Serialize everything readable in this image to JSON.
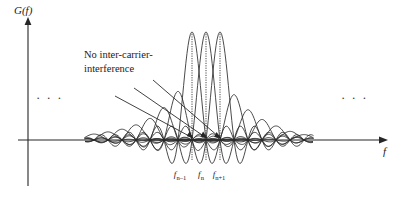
{
  "figure": {
    "title": "",
    "background_color": "#ffffff",
    "line_color": "#2a2a2a"
  },
  "axes": {
    "y_label": "G(f)",
    "x_label": "f",
    "y_axis_x_px": 28,
    "baseline_y_px": 140
  },
  "annotation": {
    "line1": "No inter-carrier-",
    "line2": "interference",
    "leader_count": 3
  },
  "ellipsis": {
    "left": "· · ·",
    "right": "· · ·"
  },
  "tick_labels": [
    {
      "base": "f",
      "sub": "n–1",
      "x_px": 180
    },
    {
      "base": "f",
      "sub": "n",
      "x_px": 201
    },
    {
      "base": "f",
      "sub": "n+1",
      "x_px": 219
    }
  ],
  "chart_data": {
    "type": "line",
    "title": "",
    "xlabel": "f",
    "ylabel": "G(f)",
    "grid": false,
    "legend": null,
    "baseline_value": 0,
    "subcarrier_spacing_px": 14,
    "marked_carriers": [
      {
        "label": "f_n-1",
        "center_px": 192,
        "peak_amplitude": 1.0
      },
      {
        "label": "f_n",
        "center_px": 206,
        "peak_amplitude": 1.0
      },
      {
        "label": "f_n+1",
        "center_px": 220,
        "peak_amplitude": 1.0
      }
    ],
    "series": [
      {
        "name": "sinc-1",
        "center_px": 94,
        "peak_amplitude": 0.055
      },
      {
        "name": "sinc-2",
        "center_px": 108,
        "peak_amplitude": 0.075
      },
      {
        "name": "sinc-3",
        "center_px": 122,
        "peak_amplitude": 0.1
      },
      {
        "name": "sinc-4",
        "center_px": 136,
        "peak_amplitude": 0.14
      },
      {
        "name": "sinc-5",
        "center_px": 150,
        "peak_amplitude": 0.2
      },
      {
        "name": "sinc-6",
        "center_px": 164,
        "peak_amplitude": 0.3
      },
      {
        "name": "sinc-7",
        "center_px": 178,
        "peak_amplitude": 0.45
      },
      {
        "name": "sinc-8",
        "center_px": 192,
        "peak_amplitude": 1.0
      },
      {
        "name": "sinc-9",
        "center_px": 206,
        "peak_amplitude": 1.0
      },
      {
        "name": "sinc-10",
        "center_px": 220,
        "peak_amplitude": 1.0
      },
      {
        "name": "sinc-11",
        "center_px": 234,
        "peak_amplitude": 0.42
      },
      {
        "name": "sinc-12",
        "center_px": 248,
        "peak_amplitude": 0.28
      },
      {
        "name": "sinc-13",
        "center_px": 262,
        "peak_amplitude": 0.19
      },
      {
        "name": "sinc-14",
        "center_px": 276,
        "peak_amplitude": 0.13
      },
      {
        "name": "sinc-15",
        "center_px": 290,
        "peak_amplitude": 0.08
      },
      {
        "name": "sinc-16",
        "center_px": 304,
        "peak_amplitude": 0.05
      }
    ]
  }
}
